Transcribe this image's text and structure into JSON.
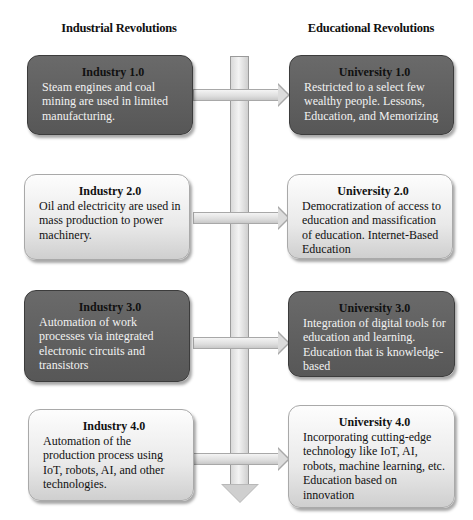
{
  "headers": {
    "left": "Industrial Revolutions",
    "right": "Educational Revolutions"
  },
  "industrial": [
    {
      "title": "Industry 1.0",
      "description": "Steam engines and coal mining are used in limited manufacturing.",
      "style": "dark"
    },
    {
      "title": "Industry 2.0",
      "description": "Oil and electricity are used in mass production to power machinery.",
      "style": "light"
    },
    {
      "title": "Industry 3.0",
      "description": "Automation of work processes via integrated electronic circuits and transistors",
      "style": "dark"
    },
    {
      "title": "Industry 4.0",
      "description": "Automation of the production process using IoT, robots, AI, and other technologies.",
      "style": "light"
    }
  ],
  "educational": [
    {
      "title": "University 1.0",
      "description": "Restricted to a select few wealthy people. Lessons, Education, and Memorizing",
      "style": "dark"
    },
    {
      "title": "University 2.0",
      "description": "Democratization of access to education and massification of education. Internet-Based Education",
      "style": "light"
    },
    {
      "title": "University 3.0",
      "description": "Integration of digital tools for education and learning. Education that is knowledge-based",
      "style": "dark"
    },
    {
      "title": "University 4.0",
      "description": "Incorporating cutting-edge technology like IoT, AI, robots, machine learning, etc. Education based on innovation",
      "style": "light"
    }
  ],
  "colors": {
    "dark_box": "#5f5f5f",
    "light_box": "#e9e9e9",
    "arrow": "#d9d9d9"
  }
}
